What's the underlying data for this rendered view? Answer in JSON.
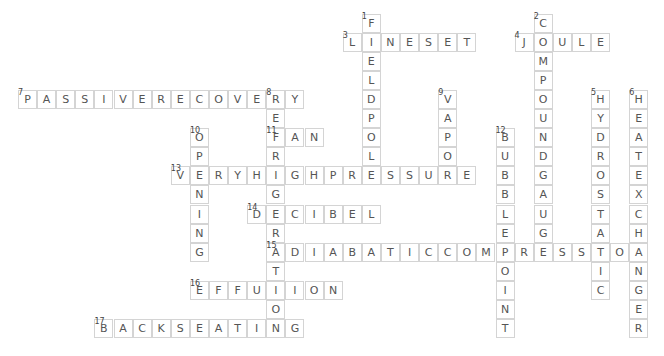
{
  "puzzle": {
    "cell_size": 19.1,
    "origin_x": 18,
    "origin_y": 13.5,
    "colors": {
      "border": "#d4d4d4",
      "letter": "#555555",
      "number": "#444444",
      "background": "#ffffff"
    },
    "words": [
      {
        "number": 1,
        "direction": "down",
        "row": 0,
        "col": 18,
        "answer": "FIELDPOLE"
      },
      {
        "number": 2,
        "direction": "down",
        "row": 0,
        "col": 27,
        "answer": "COMPOUNDGAUGE"
      },
      {
        "number": 3,
        "direction": "across",
        "row": 1,
        "col": 17,
        "answer": "LINESET"
      },
      {
        "number": 4,
        "direction": "across",
        "row": 1,
        "col": 26,
        "answer": "JOULE"
      },
      {
        "number": 5,
        "direction": "down",
        "row": 4,
        "col": 30,
        "answer": "HYDROSTATIC"
      },
      {
        "number": 6,
        "direction": "down",
        "row": 4,
        "col": 32,
        "answer": "HEATEXCHANGER"
      },
      {
        "number": 7,
        "direction": "across",
        "row": 4,
        "col": 0,
        "answer": "PASSIVERECOVERY"
      },
      {
        "number": 8,
        "direction": "down",
        "row": 4,
        "col": 13,
        "answer": "REFRIGERATION"
      },
      {
        "number": 9,
        "direction": "down",
        "row": 4,
        "col": 22,
        "answer": "VAPOR"
      },
      {
        "number": 10,
        "direction": "down",
        "row": 6,
        "col": 9,
        "answer": "OPENING"
      },
      {
        "number": 11,
        "direction": "across",
        "row": 6,
        "col": 13,
        "answer": "FAN"
      },
      {
        "number": 12,
        "direction": "down",
        "row": 6,
        "col": 25,
        "answer": "BUBBLEPOINT"
      },
      {
        "number": 13,
        "direction": "across",
        "row": 8,
        "col": 8,
        "answer": "VERYHIGHPRESSURE"
      },
      {
        "number": 14,
        "direction": "across",
        "row": 10,
        "col": 12,
        "answer": "DECIBEL"
      },
      {
        "number": 15,
        "direction": "across",
        "row": 12,
        "col": 13,
        "answer": "ADIABATICCOMPRESSION"
      },
      {
        "number": 16,
        "direction": "across",
        "row": 14,
        "col": 9,
        "answer": "EFFUSION"
      },
      {
        "number": 17,
        "direction": "across",
        "row": 16,
        "col": 4,
        "answer": "BACKSEATING"
      }
    ]
  }
}
